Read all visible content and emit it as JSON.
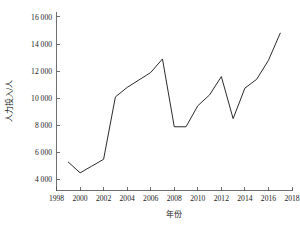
{
  "chart_data": {
    "type": "line",
    "title": "",
    "xlabel": "年份",
    "ylabel": "人力投入/人",
    "xlim": [
      1998,
      2018
    ],
    "ylim": [
      3200,
      16400
    ],
    "grid": false,
    "legend": false,
    "x": [
      1999,
      2000,
      2001,
      2002,
      2003,
      2004,
      2005,
      2006,
      2007,
      2008,
      2009,
      2010,
      2011,
      2012,
      2013,
      2014,
      2015,
      2016,
      2017
    ],
    "values": [
      5300,
      4500,
      5000,
      5500,
      10100,
      10800,
      11350,
      11900,
      12900,
      7900,
      7900,
      9450,
      10250,
      11600,
      8500,
      10750,
      11400,
      12800,
      14800
    ],
    "series": [
      {
        "name": "人力投入",
        "values": [
          5300,
          4500,
          5000,
          5500,
          10100,
          10800,
          11350,
          11900,
          12900,
          7900,
          7900,
          9450,
          10250,
          11600,
          8500,
          10750,
          11400,
          12800,
          14800
        ]
      }
    ],
    "xticks": [
      1998,
      2000,
      2002,
      2004,
      2006,
      2008,
      2010,
      2012,
      2014,
      2016,
      2018
    ],
    "xtick_labels": [
      "1998",
      "2000",
      "2002",
      "2004",
      "2006",
      "2008",
      "2010",
      "2012",
      "2014",
      "2016",
      "2018"
    ],
    "yticks": [
      4000,
      6000,
      8000,
      10000,
      12000,
      14000,
      16000
    ],
    "ytick_labels": [
      "4 000",
      "6 000",
      "8 000",
      "10 000",
      "12 000",
      "14 000",
      "16 000"
    ],
    "line_color": "#2b2b2b",
    "axis_color": "#4a4a4a",
    "background_color": "#ffffff"
  }
}
